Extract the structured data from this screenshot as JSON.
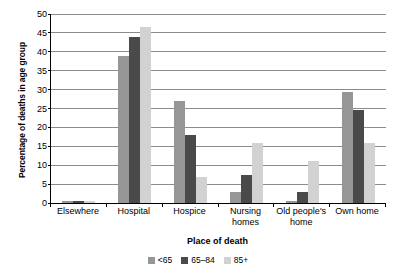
{
  "chart_data": {
    "type": "bar",
    "title": "",
    "xlabel": "Place of death",
    "ylabel": "Percentage of deaths in age group",
    "ylim": [
      0,
      50
    ],
    "yticks": [
      0,
      5,
      10,
      15,
      20,
      25,
      30,
      35,
      40,
      45,
      50
    ],
    "ytick_labels": [
      "0",
      "5",
      "10",
      "15",
      "20",
      "25",
      "30",
      "35",
      "40",
      "45",
      "50"
    ],
    "grid": true,
    "legend_position": "bottom",
    "categories": [
      "Elsewhere",
      "Hospital",
      "Hospice",
      "Nursing\nhomes",
      "Old people's\nhome",
      "Own home"
    ],
    "series": [
      {
        "name": "<65",
        "color": "#969696",
        "values": [
          0.5,
          39.0,
          27.0,
          3.0,
          0.5,
          29.5
        ]
      },
      {
        "name": "65–84",
        "color": "#4a4a4a",
        "values": [
          0.5,
          44.0,
          18.0,
          7.5,
          3.0,
          24.5
        ]
      },
      {
        "name": "85+",
        "color": "#d2d2d2",
        "values": [
          0.5,
          46.5,
          7.0,
          16.0,
          11.0,
          16.0
        ]
      }
    ]
  }
}
